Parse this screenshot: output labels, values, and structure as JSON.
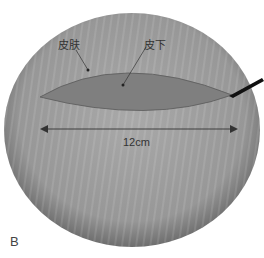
{
  "figure": {
    "panel_label": "B",
    "labels": {
      "skin": "皮肤",
      "subcutaneous": "皮下"
    },
    "dimension": {
      "text": "12cm"
    },
    "colors": {
      "background": "#ffffff",
      "circle_fill": "#9a9a9a",
      "circle_edge": "#6f6f6f",
      "incision_fill": "#7d7d7d",
      "incision_edge": "#5a5a5a",
      "arrow": "#333333",
      "scalpel": "#111111"
    }
  }
}
